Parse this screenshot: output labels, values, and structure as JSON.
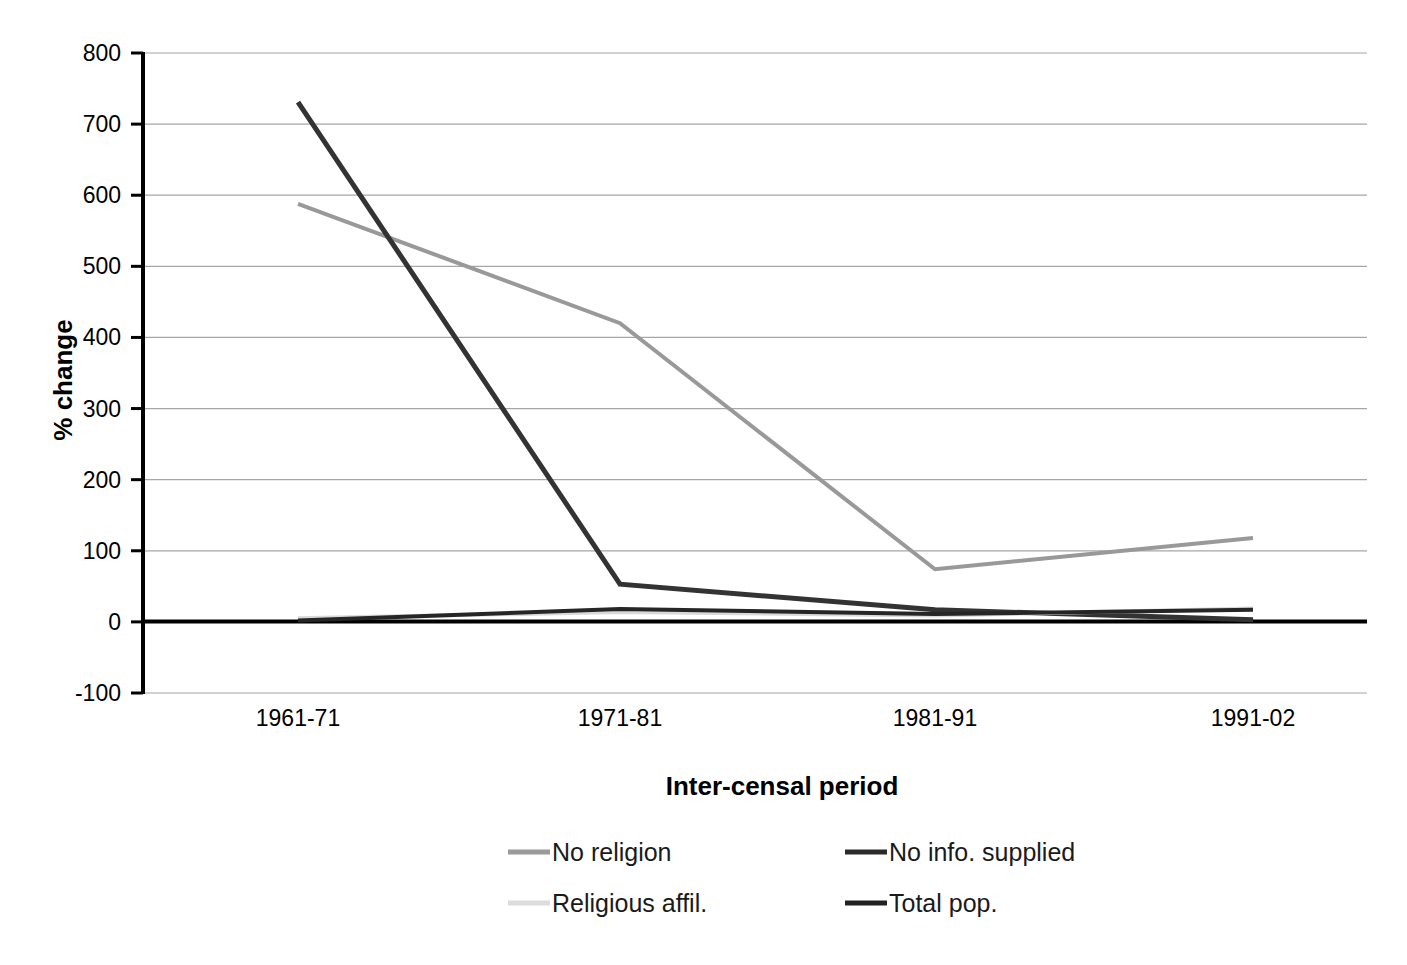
{
  "chart_data": {
    "type": "line",
    "title": "",
    "subtitle": "",
    "xlabel": "Inter-censal period",
    "ylabel": "% change",
    "categories": [
      "1961-71",
      "1971-81",
      "1981-91",
      "1991-02"
    ],
    "ylim": [
      -100,
      800
    ],
    "ytick_labels": [
      "800",
      "700",
      "600",
      "500",
      "400",
      "300",
      "200",
      "100",
      "0",
      "-100"
    ],
    "ytick_values": [
      800,
      700,
      600,
      500,
      400,
      300,
      200,
      100,
      0,
      -100
    ],
    "grid": true,
    "grid_axis": "y",
    "legend_position": "bottom",
    "series": [
      {
        "name": "No religion",
        "values": [
          588,
          420,
          74,
          118
        ],
        "color": "#999999",
        "width": 4
      },
      {
        "name": "No info. supplied",
        "values": [
          731,
          53,
          17,
          3
        ],
        "color": "#333333",
        "width": 5
      },
      {
        "name": "Religious affil.",
        "values": [
          5,
          14,
          9,
          19
        ],
        "color": "#d9d9d9",
        "width": 4
      },
      {
        "name": "Total pop.",
        "values": [
          2,
          18,
          11,
          17
        ],
        "color": "#262626",
        "width": 4
      }
    ]
  },
  "axes": {
    "y_title": "% change",
    "x_title": "Inter-censal period"
  },
  "legend": {
    "entries": [
      {
        "label": "No religion",
        "color": "#9a9a9a"
      },
      {
        "label": "No info. supplied",
        "color": "#2b2b2b"
      },
      {
        "label": "Religious affil.",
        "color": "#dcdcdc"
      },
      {
        "label": "Total pop.",
        "color": "#222222"
      }
    ]
  },
  "colors": {
    "background": "#ffffff",
    "axis": "#000000",
    "grid": "#a6a6a6",
    "text": "#000000"
  }
}
